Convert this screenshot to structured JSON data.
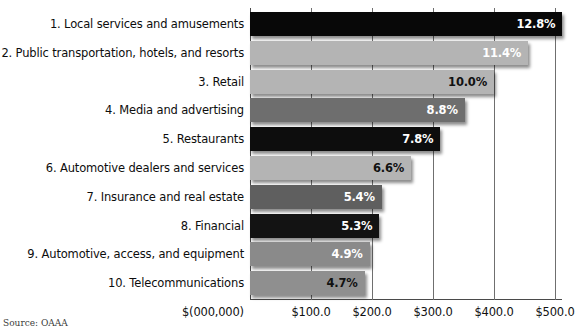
{
  "chart_data": {
    "type": "bar",
    "orientation": "horizontal",
    "title": "",
    "subtitle": "",
    "xlabel": "$(000,000)",
    "ylabel": "",
    "xlim": [
      0,
      512
    ],
    "grid": true,
    "legend": false,
    "source_note": "Source: OAAA",
    "x_unit_label": "$(000,000)",
    "xticks": [
      "$100.0",
      "$200.0",
      "$300.0",
      "$400.0",
      "$500.0"
    ],
    "xtick_values": [
      100,
      200,
      300,
      400,
      500
    ],
    "categories": [
      "1. Local services and amusements",
      "2. Public transportation, hotels, and resorts",
      "3. Retail",
      "4. Media and advertising",
      "5. Restaurants",
      "6. Automotive dealers and services",
      "7. Insurance and real estate",
      "8. Financial",
      "9. Automotive, access, and equipment",
      "10. Telecommunications"
    ],
    "data_labels": [
      "12.8%",
      "11.4%",
      "10.0%",
      "8.8%",
      "7.8%",
      "6.6%",
      "5.4%",
      "5.3%",
      "4.9%",
      "4.7%"
    ],
    "percent_values": [
      12.8,
      11.4,
      10.0,
      8.8,
      7.8,
      6.6,
      5.4,
      5.3,
      4.9,
      4.7
    ],
    "values": [
      512,
      456,
      400,
      352,
      312,
      264,
      216,
      212,
      196,
      188
    ],
    "bar_colors": [
      "#080808",
      "#b4b4b4",
      "#b4b4b4",
      "#6e6e6e",
      "#0d0d0d",
      "#b4b4b4",
      "#5f5f5f",
      "#131313",
      "#8a8a8a",
      "#8f8f8f"
    ],
    "label_colors": [
      "#ffffff",
      "#ffffff",
      "#111111",
      "#ffffff",
      "#ffffff",
      "#111111",
      "#ffffff",
      "#ffffff",
      "#ffffff",
      "#111111"
    ],
    "axis_color": "#4a4a4a",
    "grid_color": "#6f6f6f",
    "background_color": "#ffffff"
  }
}
